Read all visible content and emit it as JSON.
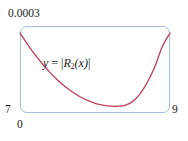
{
  "figure": {
    "frame_color": "#a6bfdc",
    "curve_color": "#c0425a",
    "background": "#ffffff"
  },
  "labels": {
    "y_max": "0.0003",
    "y_min": "7",
    "x_min": "0",
    "x_max": "9"
  },
  "annotation": {
    "equation_y": "y",
    "equation_eq": "=",
    "equation_abs_open": "|",
    "equation_r": "R",
    "equation_sub": "2",
    "equation_arg": "(x)",
    "equation_abs_close": "|"
  },
  "chart_data": {
    "type": "line",
    "title": "",
    "xlabel": "",
    "ylabel": "",
    "xlim": [
      0,
      9
    ],
    "ylim": [
      7,
      0.0003
    ],
    "grid": false,
    "legend": "none",
    "annotations": [
      {
        "text": "y = |R_2(x)|",
        "x": 1.45,
        "y": 0.000192
      }
    ],
    "axis_tick_labels": {
      "x": [
        "0",
        "9"
      ],
      "y": [
        "7",
        "0.0003"
      ]
    },
    "series": [
      {
        "name": "|R_2(x)|",
        "color": "#c0425a",
        "x": [
          0.0,
          0.45,
          0.9,
          1.35,
          1.8,
          2.25,
          2.7,
          3.15,
          3.6,
          4.05,
          4.5,
          4.95,
          5.4,
          5.85,
          6.3,
          6.75,
          7.2,
          7.65,
          8.1,
          8.55,
          9.0
        ],
        "y": [
          0.000276,
          0.000237,
          0.000201,
          0.000169,
          0.00014,
          0.000114,
          9.15e-05,
          7.22e-05,
          5.61e-05,
          4.32e-05,
          3.35e-05,
          2.69e-05,
          2.36e-05,
          2.34e-05,
          2.64e-05,
          3.92e-05,
          6.62e-05,
          0.000107,
          0.000161,
          0.00023,
          0.000276
        ]
      }
    ]
  }
}
